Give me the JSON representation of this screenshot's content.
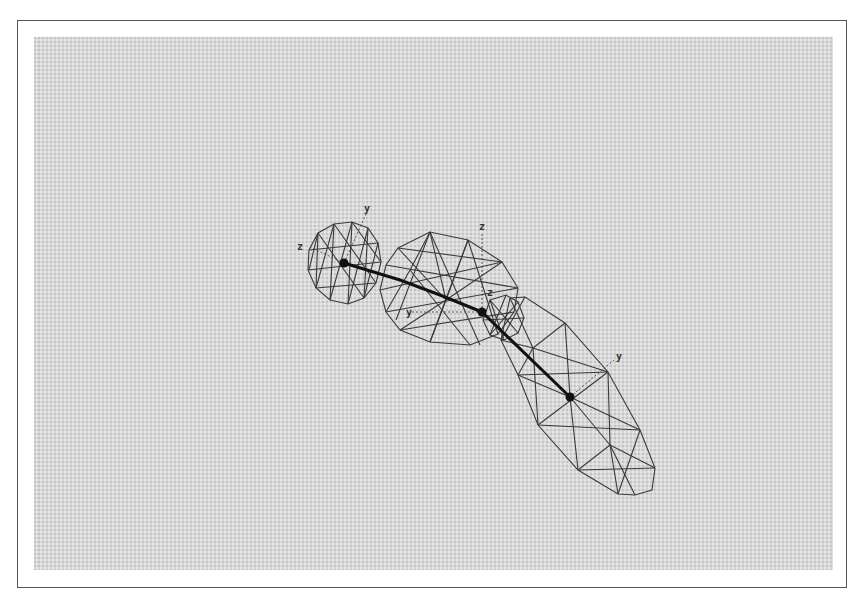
{
  "figure": {
    "colors": {
      "background": "#dadada",
      "wireframe": "#3a3a3a",
      "bone": "#111111",
      "frame": "#555555"
    },
    "segments": [
      {
        "name": "head-segment",
        "shape": "ellipsoid"
      },
      {
        "name": "middle-segment",
        "shape": "ellipsoid"
      },
      {
        "name": "lower-segment",
        "shape": "elongated ellipsoid"
      }
    ],
    "joints": [
      {
        "name": "joint-1"
      },
      {
        "name": "joint-2"
      },
      {
        "name": "joint-3"
      }
    ],
    "axis_labels": {
      "head_y": "y",
      "head_z": "z",
      "middle_z": "z",
      "joint_z": "z",
      "middle_y": "y",
      "lower_y": "y"
    }
  }
}
